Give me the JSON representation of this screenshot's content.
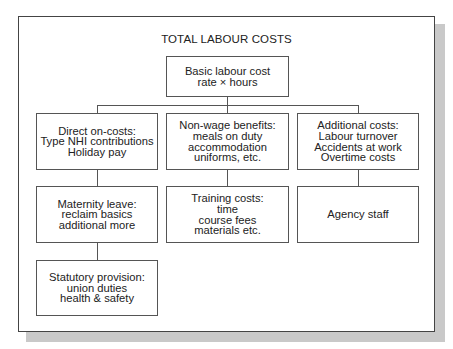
{
  "diagram": {
    "title": "TOTAL LABOUR COSTS",
    "root": {
      "lines": [
        "Basic labour cost",
        "rate × hours"
      ]
    },
    "columns": [
      {
        "boxes": [
          {
            "lines": [
              "Direct on-costs:",
              "Type NHI contributions",
              "Holiday pay"
            ]
          },
          {
            "lines": [
              "Maternity leave:",
              "reclaim basics",
              "additional more"
            ]
          },
          {
            "lines": [
              "Statutory provision:",
              "union duties",
              "health & safety"
            ]
          }
        ]
      },
      {
        "boxes": [
          {
            "lines": [
              "Non-wage benefits:",
              "meals on duty",
              "accommodation",
              "uniforms, etc."
            ]
          },
          {
            "lines": [
              "Training costs:",
              "time",
              "course fees",
              "materials etc."
            ]
          }
        ]
      },
      {
        "boxes": [
          {
            "lines": [
              "Additional costs:",
              "Labour turnover",
              "Accidents at work",
              "Overtime costs"
            ]
          },
          {
            "lines": [
              "Agency staff"
            ]
          }
        ]
      }
    ]
  }
}
